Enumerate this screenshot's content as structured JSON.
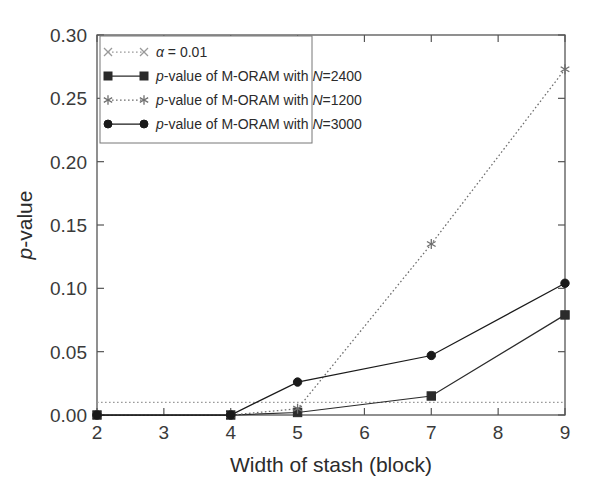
{
  "figure": {
    "background": "#ffffff",
    "plot_frame_color": "#555555"
  },
  "axes": {
    "x_title": "Width of stash (block)",
    "y_title_italic": "p",
    "y_title_rest": "-value",
    "x_ticks": [
      "2",
      "3",
      "4",
      "5",
      "6",
      "7",
      "8",
      "9"
    ],
    "y_ticks": [
      "0.00",
      "0.05",
      "0.10",
      "0.15",
      "0.20",
      "0.25",
      "0.30"
    ]
  },
  "legend": {
    "entries": [
      {
        "marker": "cross-marker-icon",
        "line_style": "dotted",
        "color": "#9a9a9a",
        "label_italic": "α",
        "label_rest": " = 0.01"
      },
      {
        "marker": "square-marker-icon",
        "line_style": "solid",
        "color": "#2b2b2b",
        "label_italic": "p",
        "label_rest": "-value of M-ORAM with ",
        "label_italic2": "N",
        "label_rest2": "=2400"
      },
      {
        "marker": "star-marker-icon",
        "line_style": "dotted",
        "color": "#6e6e6e",
        "label_italic": "p",
        "label_rest": "-value of M-ORAM with ",
        "label_italic2": "N",
        "label_rest2": "=1200"
      },
      {
        "marker": "circle-marker-icon",
        "line_style": "solid",
        "color": "#1a1a1a",
        "label_italic": "p",
        "label_rest": "-value of M-ORAM with ",
        "label_italic2": "N",
        "label_rest2": "=3000"
      }
    ]
  },
  "chart_data": {
    "type": "line",
    "title": "",
    "xlabel": "Width of stash (block)",
    "ylabel": "p-value",
    "xlim": [
      2,
      9
    ],
    "ylim": [
      0.0,
      0.3
    ],
    "xticks": [
      2,
      3,
      4,
      5,
      6,
      7,
      8,
      9
    ],
    "yticks": [
      0.0,
      0.05,
      0.1,
      0.15,
      0.2,
      0.25,
      0.3
    ],
    "grid": false,
    "legend_position": "upper-left",
    "series": [
      {
        "name": "α = 0.01",
        "marker": "x",
        "linestyle": "dotted",
        "color": "#9a9a9a",
        "x": [
          2,
          9
        ],
        "values": [
          0.01,
          0.01
        ]
      },
      {
        "name": "p-value of M-ORAM with N=2400",
        "marker": "s",
        "linestyle": "solid",
        "color": "#2b2b2b",
        "x": [
          2,
          4,
          5,
          7,
          9
        ],
        "values": [
          0.0,
          0.0,
          0.002,
          0.015,
          0.079
        ]
      },
      {
        "name": "p-value of M-ORAM with N=1200",
        "marker": "*",
        "linestyle": "dotted",
        "color": "#6e6e6e",
        "x": [
          2,
          4,
          5,
          7,
          9
        ],
        "values": [
          0.0,
          0.0,
          0.005,
          0.135,
          0.273
        ]
      },
      {
        "name": "p-value of M-ORAM with N=3000",
        "marker": "o",
        "linestyle": "solid",
        "color": "#1a1a1a",
        "x": [
          2,
          4,
          5,
          7,
          9
        ],
        "values": [
          0.0,
          0.0,
          0.026,
          0.047,
          0.104
        ]
      }
    ]
  }
}
